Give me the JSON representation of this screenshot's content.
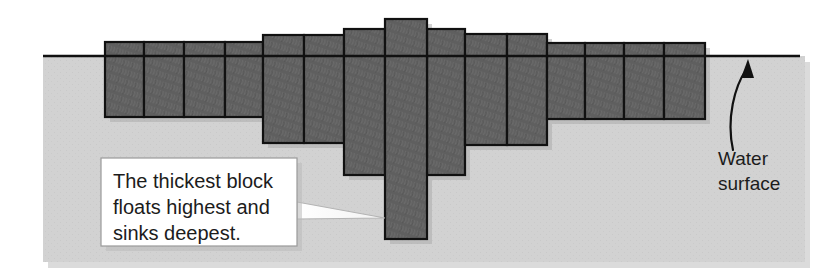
{
  "figure": {
    "width": 821,
    "height": 280
  },
  "colors": {
    "background": "#ffffff",
    "water_fill": "#d2d2d2",
    "block_fill": "#5f5f5f",
    "block_stroke": "#111111",
    "water_line": "#111111",
    "callout_fill": "#ffffff",
    "callout_stroke": "#9a9a9a",
    "text": "#1c1c1c",
    "leader_fill": "#ffffff",
    "leader_stroke": "#b4b4b4",
    "shadow": "#b9b9b9"
  },
  "water": {
    "surface_label_line1": "Water",
    "surface_label_line2": "surface",
    "surface_y": 56,
    "region": {
      "x": 43,
      "y": 56,
      "width": 762,
      "height": 206
    },
    "line": {
      "x1": 43,
      "x2": 800,
      "y": 56
    }
  },
  "callout": {
    "lines": [
      "The thickest block",
      "floats highest and",
      "sinks deepest."
    ],
    "full_text": "The thickest block floats highest and sinks deepest.",
    "box": {
      "x": 101,
      "y": 158,
      "width": 196,
      "height": 88
    },
    "leader": {
      "from_x": 297,
      "from_y_top": 202,
      "from_y_bottom": 219,
      "to_x": 385,
      "to_y": 218
    }
  },
  "arrow": {
    "name": "water-surface-pointer",
    "tail_x": 733,
    "tail_y": 150,
    "tip_x": 748,
    "tip_y": 60
  },
  "blocks": [
    {
      "id": 1,
      "x": 105,
      "top": 42,
      "bottom": 117,
      "width": 39
    },
    {
      "id": 2,
      "x": 144,
      "top": 42,
      "bottom": 117,
      "width": 40
    },
    {
      "id": 3,
      "x": 184,
      "top": 42,
      "bottom": 117,
      "width": 41
    },
    {
      "id": 4,
      "x": 225,
      "top": 42,
      "bottom": 117,
      "width": 38
    },
    {
      "id": 5,
      "x": 263,
      "top": 35,
      "bottom": 143,
      "width": 41
    },
    {
      "id": 6,
      "x": 304,
      "top": 35,
      "bottom": 143,
      "width": 40
    },
    {
      "id": 7,
      "x": 344,
      "top": 29,
      "bottom": 175,
      "width": 41
    },
    {
      "id": 8,
      "x": 385,
      "top": 19,
      "bottom": 239,
      "width": 42,
      "thickest": true
    },
    {
      "id": 9,
      "x": 427,
      "top": 29,
      "bottom": 175,
      "width": 38
    },
    {
      "id": 10,
      "x": 465,
      "top": 34,
      "bottom": 145,
      "width": 42
    },
    {
      "id": 11,
      "x": 507,
      "top": 34,
      "bottom": 145,
      "width": 40
    },
    {
      "id": 12,
      "x": 547,
      "top": 43,
      "bottom": 119,
      "width": 38
    },
    {
      "id": 13,
      "x": 585,
      "top": 43,
      "bottom": 119,
      "width": 39
    },
    {
      "id": 14,
      "x": 624,
      "top": 43,
      "bottom": 119,
      "width": 40
    },
    {
      "id": 15,
      "x": 664,
      "top": 43,
      "bottom": 119,
      "width": 41
    }
  ]
}
